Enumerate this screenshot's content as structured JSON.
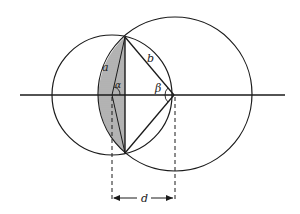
{
  "diagram": {
    "colors": {
      "stroke": "#1a1a1a",
      "hatch": "#555555",
      "background": "#ffffff"
    },
    "labels": {
      "a": "a",
      "alpha": "α",
      "b": "b",
      "beta": "β",
      "d": "d"
    },
    "geometry": {
      "axis": {
        "x1": 20,
        "x2": 285,
        "y": 95
      },
      "small_circle": {
        "cx": 112,
        "cy": 95,
        "r": 60
      },
      "large_circle": {
        "cx": 175,
        "cy": 94,
        "r": 77
      },
      "intersection_top": {
        "x": 125,
        "y": 37
      },
      "intersection_bottom": {
        "x": 125,
        "y": 153
      },
      "dimension": {
        "x1": 112,
        "x2": 175,
        "y": 198
      }
    }
  }
}
